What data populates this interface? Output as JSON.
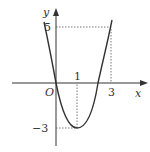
{
  "figure": {
    "axes": {
      "x_label": "x",
      "y_label": "y",
      "origin_label": "O"
    },
    "ticks": {
      "x1": "1",
      "x3": "3",
      "y5": "5",
      "yneg3": "−3"
    },
    "key_points": [
      {
        "x": 0,
        "y": 0
      },
      {
        "x": 1,
        "y": -3,
        "note": "vertex"
      },
      {
        "x": 3,
        "y": 5
      }
    ],
    "colors": {
      "curve": "#333333",
      "axes": "#333333",
      "guides": "#555555"
    }
  }
}
